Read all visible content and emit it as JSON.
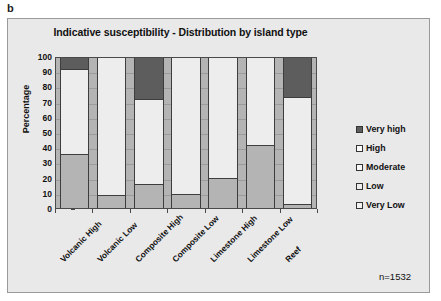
{
  "panel_label": "b",
  "sample_size_text": "n=1532",
  "chart_data": {
    "type": "bar",
    "subtype": "stacked-100-percent",
    "title": "Indicative susceptibility - Distribution by island type",
    "xlabel": "",
    "ylabel": "Percentage",
    "ylim": [
      0,
      100
    ],
    "yticks": [
      0,
      10,
      20,
      30,
      40,
      50,
      60,
      70,
      80,
      90,
      100
    ],
    "ytick_labels": [
      "0",
      "10",
      "20",
      "30",
      "40",
      "50",
      "60",
      "70",
      "80",
      "90",
      "100"
    ],
    "grid": true,
    "legend_position": "right",
    "categories": [
      "Volcanic High",
      "Volcanic Low",
      "Composite High",
      "Composite Low",
      "Limestone High",
      "Limestone Low",
      "Reef"
    ],
    "series": [
      {
        "name": "Very Low",
        "color": "#b4b4b4",
        "values": [
          36,
          8.5,
          16,
          9.5,
          20,
          42,
          3
        ]
      },
      {
        "name": "Low",
        "color": "#ededed",
        "values": [
          57,
          91.5,
          57,
          90.5,
          80,
          58,
          71
        ]
      },
      {
        "name": "Moderate",
        "color": "#f7f7f7",
        "values": [
          0,
          0,
          0,
          0,
          0,
          0,
          0
        ]
      },
      {
        "name": "High",
        "color": "#fbfbfb",
        "values": [
          0,
          0,
          0,
          0,
          0,
          0,
          0
        ]
      },
      {
        "name": "Very high",
        "color": "#5d5d5d",
        "values": [
          7,
          0,
          27,
          0,
          0,
          0,
          26
        ]
      }
    ],
    "legend": [
      {
        "label": "Very high",
        "color": "#5d5d5d"
      },
      {
        "label": "High",
        "color": "#fbfbfb"
      },
      {
        "label": "Moderate",
        "color": "#f7f7f7"
      },
      {
        "label": "Low",
        "color": "#ededed"
      },
      {
        "label": "Very Low",
        "color": "#f2f2f2"
      }
    ],
    "annotations": [
      "n=1532"
    ]
  }
}
